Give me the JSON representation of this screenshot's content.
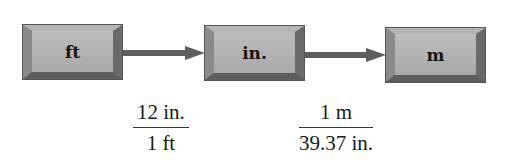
{
  "diagram": {
    "type": "unit-conversion-flow",
    "boxes": [
      {
        "label": "ft"
      },
      {
        "label": "in."
      },
      {
        "label": "m"
      }
    ],
    "arrows": [
      {
        "from": "ft",
        "to": "in."
      },
      {
        "from": "in.",
        "to": "m"
      }
    ],
    "conversion_factors": [
      {
        "numerator": "12 in.",
        "denominator": "1 ft"
      },
      {
        "numerator": "1 m",
        "denominator": "39.37 in."
      }
    ],
    "colors": {
      "box_face": "#b0b0b0",
      "box_border": "#555555",
      "arrow": "#5e5e5e",
      "text": "#151515"
    }
  }
}
